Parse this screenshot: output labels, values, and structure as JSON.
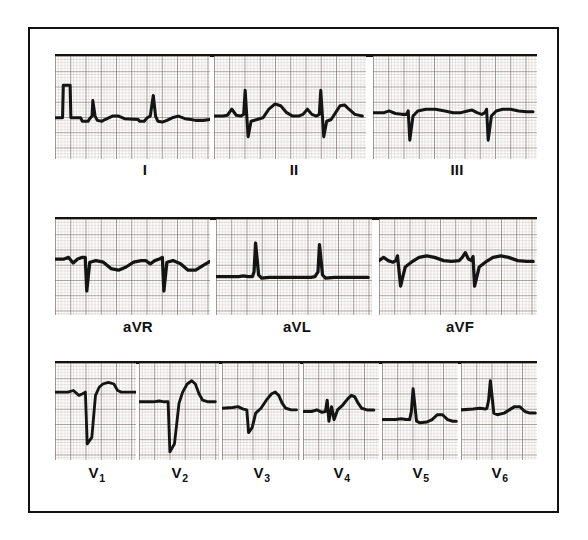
{
  "figure": {
    "kind": "12-lead-electrocardiogram",
    "title": "",
    "border_color": "#111111",
    "grid_color": "#9a8e86",
    "grid_bold_color": "#6b605a",
    "trace_color": "#141414",
    "background": "#ffffff",
    "width": 588,
    "height": 540
  },
  "rows": [
    {
      "name": "limb-leads-row",
      "y": 52,
      "height": 103,
      "label_y": 160,
      "rule": {
        "x": 53,
        "width": 482,
        "y": 52
      },
      "panels": [
        {
          "lead": "I",
          "label": "I",
          "x": 53,
          "width": 155,
          "label_cx": 143
        },
        {
          "lead": "II",
          "label": "II",
          "x": 212,
          "width": 152,
          "label_cx": 292
        },
        {
          "lead": "III",
          "label": "III",
          "x": 371,
          "width": 164,
          "label_cx": 455
        }
      ]
    },
    {
      "name": "augmented-leads-row",
      "y": 215,
      "height": 96,
      "label_y": 317,
      "rule": {
        "x": 53,
        "width": 482,
        "y": 215
      },
      "panels": [
        {
          "lead": "aVR",
          "label": "aVR",
          "x": 53,
          "width": 155,
          "label_cx": 136
        },
        {
          "lead": "aVL",
          "label": "aVL",
          "x": 214,
          "width": 156,
          "label_cx": 295
        },
        {
          "lead": "aVF",
          "label": "aVF",
          "x": 377,
          "width": 158,
          "label_cx": 458
        }
      ]
    },
    {
      "name": "precordial-leads-row",
      "y": 359,
      "height": 97,
      "label_y": 463,
      "rule": {
        "x": 53,
        "width": 482,
        "y": 359
      },
      "panels": [
        {
          "lead": "V1",
          "label": "V",
          "sub": "1",
          "x": 53,
          "width": 81,
          "label_cx": 95
        },
        {
          "lead": "V2",
          "label": "V",
          "sub": "2",
          "x": 137,
          "width": 80,
          "label_cx": 178
        },
        {
          "lead": "V3",
          "label": "V",
          "sub": "3",
          "x": 220,
          "width": 78,
          "label_cx": 260
        },
        {
          "lead": "V4",
          "label": "V",
          "sub": "4",
          "x": 301,
          "width": 76,
          "label_cx": 340
        },
        {
          "lead": "V5",
          "label": "V",
          "sub": "5",
          "x": 380,
          "width": 76,
          "label_cx": 419
        },
        {
          "lead": "V6",
          "label": "V",
          "sub": "6",
          "x": 459,
          "width": 76,
          "label_cx": 498
        }
      ]
    }
  ],
  "chart_data": {
    "type": "line",
    "xlabel": "time",
    "ylabel": "voltage",
    "grid": true,
    "legend": "none",
    "paper_speed": "25 mm/s",
    "calibration": "10 mm/mV",
    "small_grid_mm": 1,
    "large_grid_mm": 5,
    "leads": [
      {
        "name": "I",
        "baseline": 0,
        "has_calibration_pulse": true,
        "description": "small upright QRS, low-amplitude T waves, 3 beats",
        "beats": 3,
        "path": "M0,72 L10,72 L11,34 L20,34 L21,72 L34,72 L36,76 L44,76 L45,74 L49,70 L50,52 L53,70 L56,75 L62,76 L66,74 L76,70 L84,70 L92,73 L110,74 L112,76 L118,76 L122,72 L126,70 L130,46 L133,70 L136,76 L142,77 L148,75 L155,72 L163,70 L172,73 L180,74 L186,75 L196,75 L205,74"
      },
      {
        "name": "II",
        "baseline": 0,
        "has_calibration_pulse": false,
        "description": "upright P, sharp QRS with deep S, upright T, 2-3 beats",
        "beats": 3,
        "path": "M0,70 L12,70 L18,69 L24,62 L30,69 L36,70 L40,68 L42,40 L46,94 L50,76 L58,74 L66,72 L74,62 L82,56 L90,58 L98,66 L106,70 L114,70 L120,68 L126,62 L132,68 L138,70 L142,68 L144,40 L148,94 L152,76 L158,74 L164,66 L170,58 L176,57 L182,62 L190,68 L200,70"
      },
      {
        "name": "III",
        "baseline": 0,
        "has_calibration_pulse": false,
        "description": "small R with deep narrow S, flat low T, 3 beats",
        "beats": 3,
        "path": "M0,66 L14,66 L20,64 L28,67 L36,68 L42,68 L44,64 L46,98 L50,70 L56,64 L66,62 L78,62 L90,64 L100,66 L110,66 L118,64 L124,63 L130,66 L136,68 L140,66 L142,62 L144,98 L148,70 L154,64 L162,62 L172,62 L182,64 L192,65 L200,65"
      },
      {
        "name": "aVR",
        "baseline": 0,
        "has_calibration_pulse": false,
        "description": "negative QRS complexes (inverted), inverted P and T, 3 beats",
        "beats": 3,
        "path": "M0,50 L12,50 L18,48 L24,55 L30,50 L36,48 L40,48 L42,90 L46,54 L54,52 L64,54 L74,62 L84,64 L94,60 L104,54 L114,52 L120,52 L126,56 L132,52 L138,50 L142,48 L144,90 L148,54 L156,52 L166,56 L176,64 L186,64 L196,58 L205,53"
      },
      {
        "name": "aVL",
        "baseline": 0,
        "has_calibration_pulse": false,
        "description": "very low amplitude, isoelectric with small narrow R spikes, 2 beats",
        "beats": 2,
        "path": "M0,72 L30,72 L36,71 L42,72 L48,72 L50,66 L52,30 L56,70 L60,74 L70,73 L90,73 L110,73 L125,73 L130,72 L134,66 L136,32 L140,70 L144,74 L156,73 L178,73 L200,73"
      },
      {
        "name": "aVF",
        "baseline": 0,
        "has_calibration_pulse": false,
        "description": "small R, narrow deep S, broad low T, 3 beats",
        "beats": 3,
        "path": "M0,52 L6,48 L12,52 L18,54 L22,52 L24,46 L28,84 L34,60 L42,54 L52,48 L62,46 L72,48 L84,52 L94,53 L104,52 L108,48 L112,42 L116,50 L120,52 L122,47 L124,84 L130,60 L138,54 L148,48 L158,46 L168,48 L180,52 L192,53 L200,53"
      },
      {
        "name": "V1",
        "baseline": 0,
        "has_calibration_pulse": false,
        "description": "small r, very deep S (rS pattern), positive T wave",
        "beats": 1,
        "path": "M0,36 L14,36 L20,34 L26,40 L30,38 L33,36 L35,100 L40,92 L44,40 L48,30 L52,26 L58,24 L64,26 L68,34 L72,36 L80,36 L88,36"
      },
      {
        "name": "V2",
        "baseline": 0,
        "has_calibration_pulse": false,
        "description": "small r, very deep S, tall peaked T wave",
        "beats": 1,
        "path": "M0,48 L16,48 L22,47 L28,48 L32,48 L34,110 L39,100 L44,50 L48,36 L53,26 L58,22 L62,26 L66,38 L70,46 L76,48 L84,48"
      },
      {
        "name": "V3",
        "baseline": 0,
        "has_calibration_pulse": false,
        "description": "small r, deep S, tall rounded T wave",
        "beats": 1,
        "path": "M0,56 L12,55 L18,54 L24,57 L28,58 L30,86 L34,80 L38,62 L44,56 L50,46 L56,38 L60,36 L64,40 L68,50 L72,56 L78,58 L84,58"
      },
      {
        "name": "V4",
        "baseline": 0,
        "has_calibration_pulse": false,
        "description": "rS with small r, notched small complex, upright rounded T",
        "beats": 1,
        "path": "M0,60 L10,60 L16,58 L22,61 L26,60 L28,46 L30,72 L33,54 L36,70 L40,58 L46,52 L52,44 L56,40 L60,42 L64,50 L68,56 L74,58 L82,58"
      },
      {
        "name": "V5",
        "baseline": 0,
        "has_calibration_pulse": false,
        "description": "tall narrow R wave, small upright T wave",
        "beats": 1,
        "path": "M0,70 L16,70 L22,69 L28,70 L32,70 L34,60 L36,32 L40,72 L44,74 L52,73 L58,70 L64,64 L70,64 L76,70 L82,72 L86,72"
      },
      {
        "name": "V6",
        "baseline": 0,
        "has_calibration_pulse": false,
        "description": "tall narrow R wave, small broad T wave",
        "beats": 1,
        "path": "M0,58 L14,57 L22,56 L28,57 L30,56 L32,46 L34,22 L38,62 L42,64 L50,62 L56,58 L62,54 L68,54 L74,60 L80,62 L86,62"
      }
    ]
  }
}
